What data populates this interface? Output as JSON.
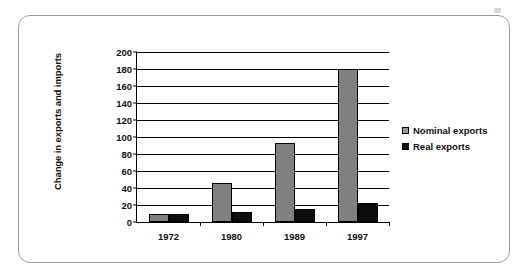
{
  "chart_data": {
    "type": "bar",
    "title": "",
    "xlabel": "",
    "ylabel": "Change in exports and imports",
    "categories": [
      "1972",
      "1980",
      "1989",
      "1997"
    ],
    "ylim": [
      0,
      200
    ],
    "ytick_step": 20,
    "yticks": [
      "200",
      "180",
      "160",
      "140",
      "120",
      "100",
      "80",
      "60",
      "40",
      "20",
      "0"
    ],
    "grid": true,
    "legend_position": "right",
    "series": [
      {
        "name": "Nominal exports",
        "color": "#808080",
        "values": [
          10,
          46,
          93,
          180
        ]
      },
      {
        "name": "Real exports",
        "color": "#0d0d0d",
        "values": [
          10,
          12,
          15,
          22
        ]
      }
    ]
  },
  "legend": {
    "items": [
      {
        "label": "Nominal exports",
        "swatch": "nominal-swatch-icon"
      },
      {
        "label": "Real exports",
        "swatch": "real-swatch-icon"
      }
    ]
  }
}
